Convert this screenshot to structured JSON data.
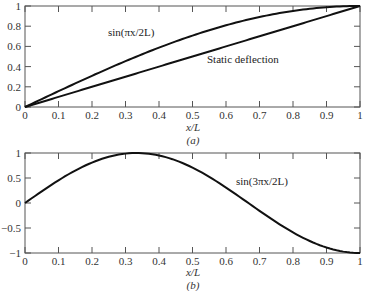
{
  "chart_data": [
    {
      "type": "line",
      "panel": "(a)",
      "xlabel": "x/L",
      "ylabel": "",
      "xlim": [
        0,
        1
      ],
      "ylim": [
        0,
        1
      ],
      "xticks": [
        "0",
        "0.1",
        "0.2",
        "0.3",
        "0.4",
        "0.5",
        "0.6",
        "0.7",
        "0.8",
        "0.9",
        "1"
      ],
      "yticks": [
        "0",
        "0.2",
        "0.4",
        "0.6",
        "0.8",
        "1"
      ],
      "grid": false,
      "x": [
        0,
        0.1,
        0.2,
        0.3,
        0.4,
        0.5,
        0.6,
        0.7,
        0.8,
        0.9,
        1.0
      ],
      "series": [
        {
          "name": "sin(πx/2L)",
          "values": [
            0,
            0.156,
            0.309,
            0.454,
            0.588,
            0.707,
            0.809,
            0.891,
            0.951,
            0.988,
            1.0
          ]
        },
        {
          "name": "Static deflection",
          "values": [
            0,
            0.1,
            0.2,
            0.3,
            0.4,
            0.5,
            0.6,
            0.7,
            0.8,
            0.9,
            1.0
          ]
        }
      ],
      "annotations": [
        {
          "text": "sin(πx/2L)",
          "x": 0.35,
          "y": 0.74
        },
        {
          "text": "Static deflection",
          "x": 0.54,
          "y": 0.58
        }
      ]
    },
    {
      "type": "line",
      "panel": "(b)",
      "xlabel": "x/L",
      "ylabel": "",
      "xlim": [
        0,
        1
      ],
      "ylim": [
        -1,
        1
      ],
      "xticks": [
        "0",
        "0.1",
        "0.2",
        "0.3",
        "0.4",
        "0.5",
        "0.6",
        "0.7",
        "0.8",
        "0.9",
        "1"
      ],
      "yticks": [
        "-1",
        "-0.5",
        "0",
        "0.5",
        "1"
      ],
      "grid": false,
      "x": [
        0,
        0.1,
        0.2,
        0.3,
        0.333,
        0.4,
        0.5,
        0.6,
        0.7,
        0.8,
        0.9,
        1.0
      ],
      "series": [
        {
          "name": "sin(3πx/2L)",
          "values": [
            0,
            0.454,
            0.809,
            0.988,
            1.0,
            0.951,
            0.707,
            0.309,
            -0.156,
            -0.588,
            -0.891,
            -1.0
          ]
        }
      ],
      "annotations": [
        {
          "text": "sin(3πx/2L)",
          "x": 0.63,
          "y": 0.5
        }
      ]
    }
  ],
  "panel_a": {
    "xlabel": "x/L",
    "caption": "(a)",
    "label_sin": "sin(πx/2L)",
    "label_static": "Static deflection"
  },
  "panel_b": {
    "xlabel": "x/L",
    "caption": "(b)",
    "label_sin3": "sin(3πx/2L)"
  },
  "colors": {
    "curve": "#111111",
    "axis": "#555555",
    "text": "#333333"
  }
}
